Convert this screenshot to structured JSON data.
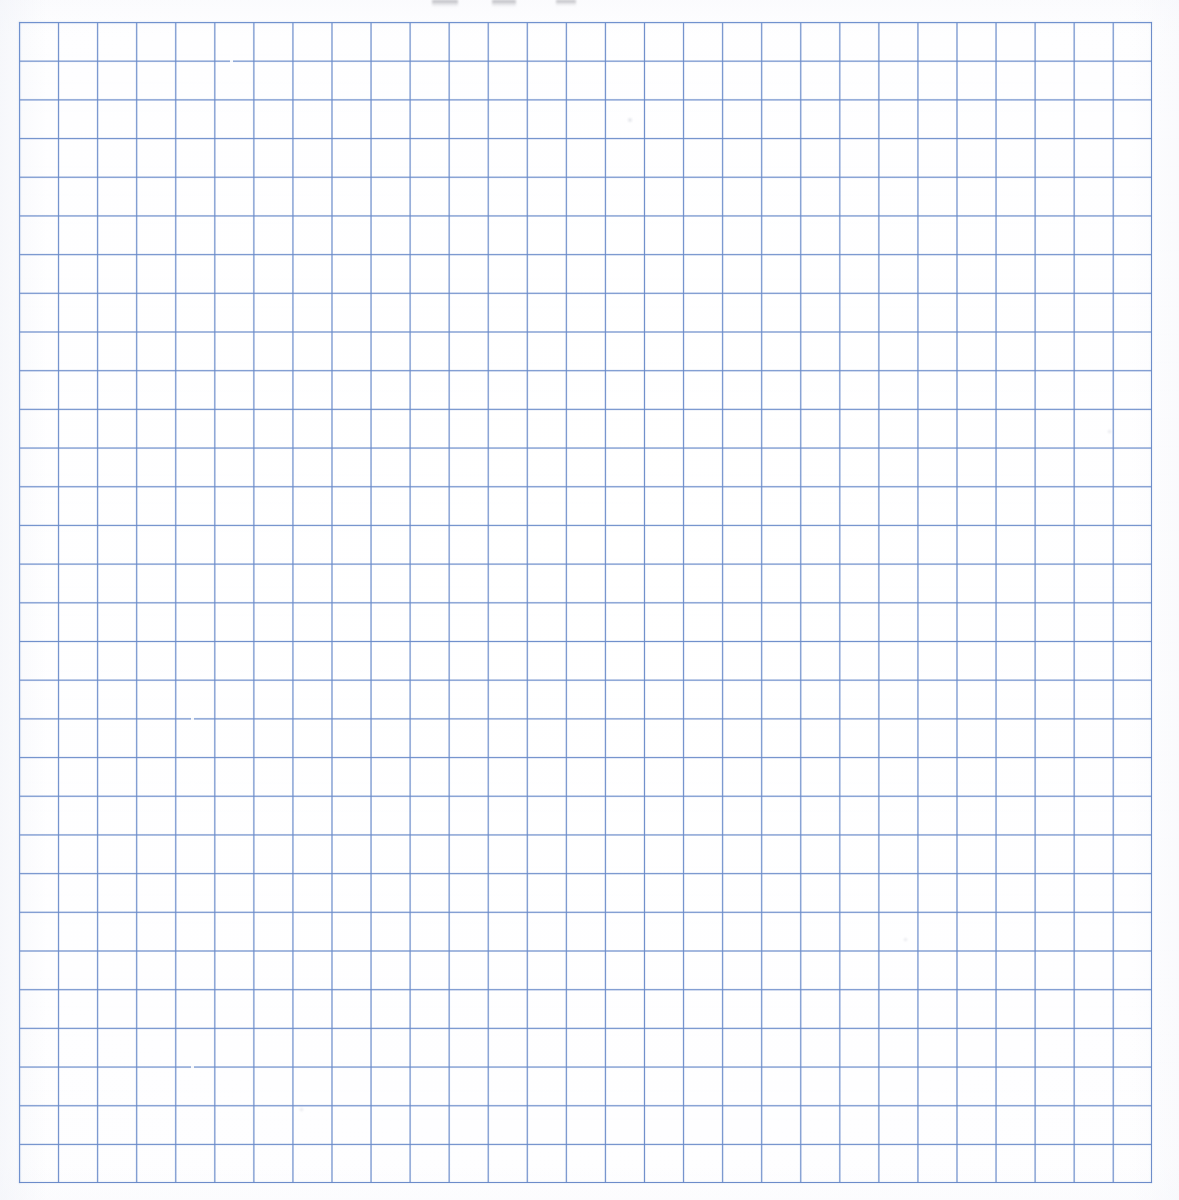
{
  "document": {
    "kind": "graph-paper-scan",
    "title": "Blank blue quadrille graph paper",
    "surface": "white paper sheet",
    "visible_text": ""
  },
  "canvas": {
    "width_px": 1179,
    "height_px": 1200,
    "background_color": "#ffffff"
  },
  "grid": {
    "label": "blue ruled square grid",
    "origin_x_px": 19,
    "origin_y_px": 22,
    "width_px": 1133,
    "height_px": 1161,
    "columns": 29,
    "rows": 30,
    "cell_width_px": 39.07,
    "cell_height_px": 38.7,
    "line_color": "#6889c8",
    "line_color_light": "#7696d2",
    "line_width_px": 1.2,
    "paper_color": "#ffffff",
    "has_major_lines": false,
    "has_axis_labels": false,
    "has_tick_labels": false,
    "has_annotations": false
  },
  "artifacts": {
    "label": "scan imperfections",
    "top_crop_marks": [
      {
        "left_px": 432,
        "width_px": 26,
        "height_px": 7
      },
      {
        "left_px": 492,
        "width_px": 24,
        "height_px": 7
      },
      {
        "left_px": 556,
        "width_px": 20,
        "height_px": 6
      }
    ],
    "ink_gaps": [
      {
        "left_px": 172,
        "top_px": 672,
        "width_px": 3,
        "height_px": 26
      },
      {
        "left_px": 172,
        "top_px": 742,
        "width_px": 3,
        "height_px": 22
      },
      {
        "left_px": 211,
        "top_px": 30,
        "width_px": 3,
        "height_px": 18
      },
      {
        "left_px": 540,
        "top_px": 520,
        "width_px": 3,
        "height_px": 20
      },
      {
        "left_px": 172,
        "top_px": 1034,
        "width_px": 3,
        "height_px": 16
      },
      {
        "left_px": 630,
        "top_px": 92,
        "width_px": 3,
        "height_px": 14
      }
    ],
    "specks": [
      {
        "left_px": 628,
        "top_px": 118,
        "size_px": 4
      },
      {
        "left_px": 904,
        "top_px": 938,
        "size_px": 3
      },
      {
        "left_px": 300,
        "top_px": 1108,
        "size_px": 3
      },
      {
        "left_px": 1108,
        "top_px": 430,
        "size_px": 3
      }
    ]
  }
}
